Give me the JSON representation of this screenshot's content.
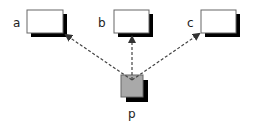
{
  "diagram": {
    "nodes": [
      {
        "id": "a",
        "label": "a",
        "fill": "#ffffff"
      },
      {
        "id": "b",
        "label": "b",
        "fill": "#ffffff"
      },
      {
        "id": "c",
        "label": "c",
        "fill": "#ffffff"
      },
      {
        "id": "p",
        "label": "p",
        "fill": "#a9a9a9"
      }
    ],
    "edges": [
      {
        "from": "p",
        "to": "a",
        "style": "dashed",
        "arrow": "filled"
      },
      {
        "from": "p",
        "to": "b",
        "style": "dashed",
        "arrow": "filled"
      },
      {
        "from": "p",
        "to": "c",
        "style": "dashed",
        "arrow": "filled"
      }
    ],
    "colors": {
      "shadow": "#000000",
      "border": "#555555",
      "line": "#444444"
    }
  }
}
